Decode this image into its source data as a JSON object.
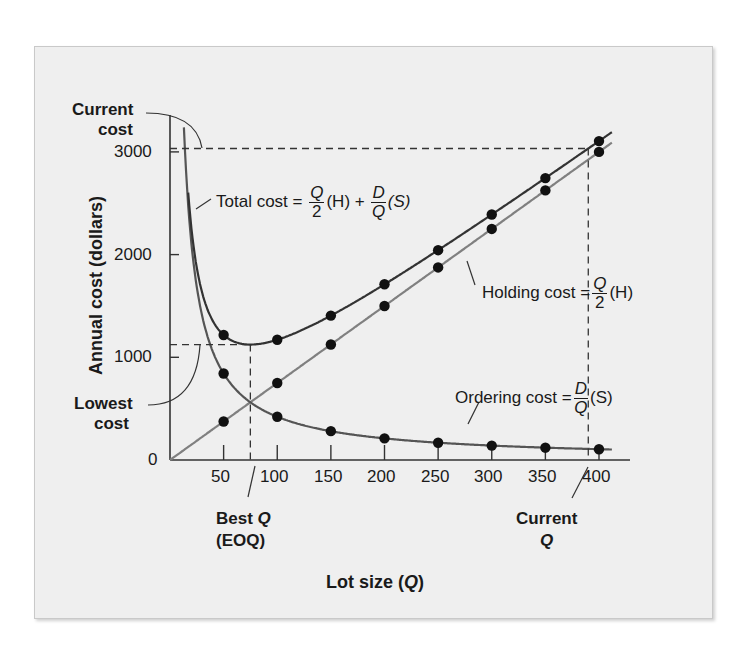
{
  "chart_data": {
    "type": "line",
    "title": "",
    "xlabel": "Lot size (Q)",
    "ylabel": "Annual cost (dollars)",
    "xlim": [
      0,
      420
    ],
    "ylim": [
      0,
      3300
    ],
    "x_ticks": [
      50,
      100,
      150,
      200,
      250,
      300,
      350,
      400
    ],
    "y_ticks": [
      0,
      1000,
      2000,
      3000
    ],
    "grid": false,
    "x": [
      50,
      100,
      150,
      200,
      250,
      300,
      350,
      400
    ],
    "series": [
      {
        "name": "Total cost",
        "formula": "Total cost = Q/2 (H) + D/Q (S)",
        "values": [
          1217,
          1171,
          1406,
          1711,
          2043,
          2390,
          2745,
          3105
        ],
        "color": "#333333"
      },
      {
        "name": "Holding cost",
        "formula": "Holding cost = Q/2 (H)",
        "values": [
          375,
          750,
          1125,
          1500,
          1875,
          2250,
          2625,
          3000
        ],
        "color": "#808080"
      },
      {
        "name": "Ordering cost",
        "formula": "Ordering cost = D/Q (S)",
        "values": [
          842,
          421,
          281,
          211,
          168,
          140,
          120,
          105
        ],
        "color": "#555555"
      }
    ],
    "annotations": [
      {
        "text": "Current cost",
        "y": 3105
      },
      {
        "text": "Lowest cost",
        "y": 1124
      },
      {
        "text": "Best Q (EOQ)",
        "x": 79
      },
      {
        "text": "Current Q",
        "x": 390
      }
    ]
  },
  "labels": {
    "y_axis": "Annual cost (dollars)",
    "x_axis_pre": "Lot size (",
    "x_axis_q": "Q",
    "x_axis_post": ")",
    "current_cost_1": "Current",
    "current_cost_2": "cost",
    "lowest_cost_1": "Lowest",
    "lowest_cost_2": "cost",
    "best_q_1": "Best ",
    "best_q_q": "Q",
    "best_q_2": "(EOQ)",
    "current_q_1": "Current",
    "current_q_2": "Q",
    "total_cost": "Total cost =",
    "holding_cost": "Holding cost =",
    "ordering_cost": "Ordering cost =",
    "Q": "Q",
    "two": "2",
    "D": "D",
    "H_paren": "(H)",
    "S_paren": "(S)",
    "plus": "+"
  },
  "ticks": {
    "x": [
      "50",
      "100",
      "150",
      "200",
      "250",
      "300",
      "350",
      "400"
    ],
    "y": [
      "0",
      "1000",
      "2000",
      "3000"
    ]
  }
}
